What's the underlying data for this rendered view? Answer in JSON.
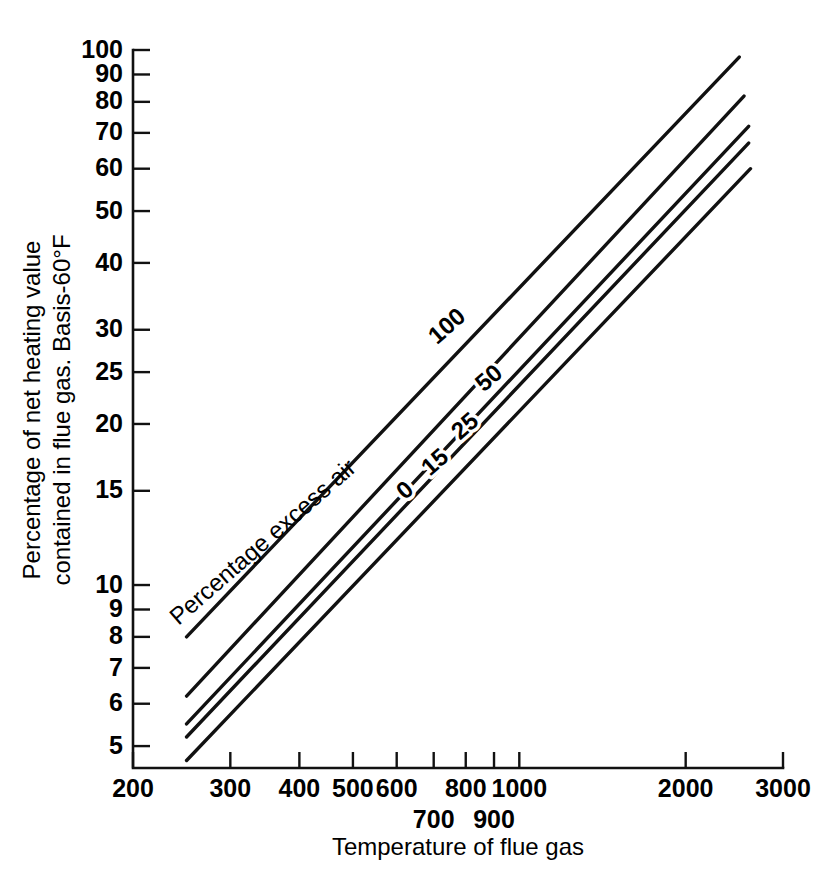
{
  "chart_data": {
    "type": "line",
    "title": "",
    "xlabel": "Temperature of flue gas",
    "ylabel_line1": "Percentage of net heating value",
    "ylabel_line2": "contained in flue gas. Basis-60°F",
    "xscale": "log",
    "yscale": "log",
    "xlim": [
      200,
      3000
    ],
    "ylim": [
      4.55,
      100
    ],
    "grid": false,
    "legend_position": "inline-curve-labels",
    "series_group_label": "Percentage excess air",
    "xticks": [
      200,
      300,
      400,
      500,
      600,
      700,
      800,
      900,
      1000,
      2000,
      3000
    ],
    "xtick_labels_top": [
      "200",
      "300",
      "400",
      "500",
      "600",
      "",
      "800",
      "",
      "1000",
      "2000",
      "3000"
    ],
    "xtick_labels_bottom": [
      "",
      "",
      "",
      "",
      "",
      "700",
      "",
      "900",
      "",
      "",
      ""
    ],
    "yticks": [
      100,
      90,
      80,
      70,
      60,
      50,
      40,
      30,
      25,
      20,
      15,
      10,
      9,
      8,
      7,
      6,
      5
    ],
    "ytick_labels": [
      "100",
      "90",
      "80",
      "70",
      "60",
      "50",
      "40",
      "30",
      "25",
      "20",
      "15",
      "10",
      "9",
      "8",
      "7",
      "6",
      "5"
    ],
    "series": [
      {
        "name": "100",
        "label": "100",
        "excess_air_percent": 100,
        "points": [
          [
            250,
            8.0
          ],
          [
            2500,
            97.0
          ]
        ]
      },
      {
        "name": "50",
        "label": "50",
        "excess_air_percent": 50,
        "points": [
          [
            250,
            6.2
          ],
          [
            2550,
            82.0
          ]
        ]
      },
      {
        "name": "25",
        "label": "25",
        "excess_air_percent": 25,
        "points": [
          [
            250,
            5.5
          ],
          [
            2600,
            72.0
          ]
        ]
      },
      {
        "name": "15",
        "label": "15",
        "excess_air_percent": 15,
        "points": [
          [
            250,
            5.2
          ],
          [
            2600,
            67.0
          ]
        ]
      },
      {
        "name": "0",
        "label": "0",
        "excess_air_percent": 0,
        "points": [
          [
            250,
            4.7
          ],
          [
            2620,
            60.0
          ]
        ]
      }
    ],
    "curve_labels": [
      {
        "text": "100",
        "x": 452,
        "y": 332,
        "rotate": -41
      },
      {
        "text": "50",
        "x": 494,
        "y": 384,
        "rotate": -41
      },
      {
        "text": "25",
        "x": 470,
        "y": 432,
        "rotate": -41
      },
      {
        "text": "15",
        "x": 440,
        "y": 468,
        "rotate": -41
      },
      {
        "text": "0",
        "x": 410,
        "y": 496,
        "rotate": -41
      }
    ],
    "inline_annotation": {
      "text": "Percentage excess air",
      "x": 268,
      "y": 548,
      "rotate": -41
    }
  }
}
